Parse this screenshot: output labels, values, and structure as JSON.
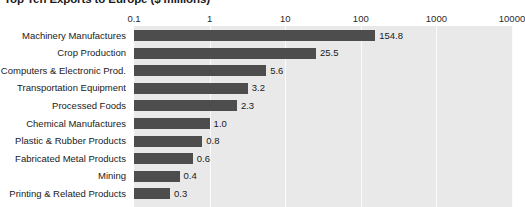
{
  "chart_data": {
    "type": "bar",
    "orientation": "horizontal",
    "title": "Top Ten Exports to Europe ($ millions)",
    "xlabel": "",
    "ylabel": "",
    "xscale": "log",
    "xlim": [
      0.1,
      10000
    ],
    "xticks": [
      "0.1",
      "1",
      "10",
      "100",
      "1000",
      "10000"
    ],
    "xtick_values": [
      0.1,
      1,
      10,
      100,
      1000,
      10000
    ],
    "grid": true,
    "legend": null,
    "categories": [
      "Machinery Manufactures",
      "Crop Production",
      "Computers & Electronic Prod.",
      "Transportation Equipment",
      "Processed Foods",
      "Chemical Manufactures",
      "Plastic & Rubber Products",
      "Fabricated Metal Products",
      "Mining",
      "Printing & Related Products"
    ],
    "values": [
      154.8,
      25.5,
      5.6,
      3.2,
      2.3,
      1.0,
      0.8,
      0.6,
      0.4,
      0.3
    ],
    "value_labels": [
      "154.8",
      "25.5",
      "5.6",
      "3.2",
      "2.3",
      "1.0",
      "0.8",
      "0.6",
      "0.4",
      "0.3"
    ],
    "colors": {
      "bar": "#4d4d4d",
      "plot_background": "#e9e9e9",
      "gridline": "#fbfbfb",
      "page_background": "#ffffff",
      "text": "#1a1a1a"
    }
  }
}
